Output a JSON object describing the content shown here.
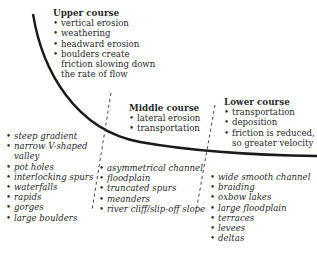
{
  "upper": {
    "title": "Upper course",
    "processes": [
      "vertical erosion",
      "weathering",
      "headward erosion",
      "boulders create friction slowing down the rate of flow"
    ],
    "features": [
      "steep gradient",
      "narrow V-shaped valley",
      "pot holes",
      "interlocking spurs",
      "waterfalls",
      "rapids",
      "gorges",
      "large boulders"
    ]
  },
  "middle": {
    "title": "Middle course",
    "processes": [
      "lateral erosion",
      "transportation"
    ],
    "features": [
      "asymmetrical channel",
      "floodplain",
      "truncated spurs",
      "meanders",
      "river cliff/slip-off slope"
    ]
  },
  "lower": {
    "title": "Lower course",
    "processes": [
      "transportation",
      "deposition",
      "friction is reduced, so greater velocity"
    ],
    "features": [
      "wide smooth channel",
      "braiding",
      "oxbow lakes",
      "large floodplain",
      "terraces",
      "levees",
      "deltas"
    ]
  },
  "colors": {
    "line": "#1a1a1a",
    "text": "#2a2a2a"
  }
}
